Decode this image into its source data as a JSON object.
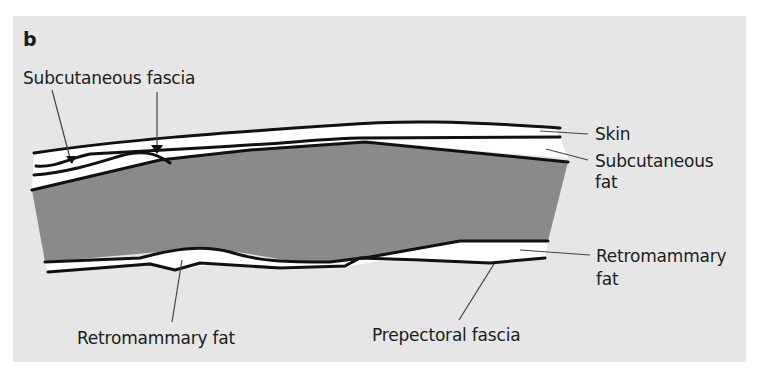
{
  "figure": {
    "panel_letter": "b",
    "colors": {
      "background": "#ffffff",
      "panel": "#e6e6e6",
      "glandular_tissue": "#8a8a8a",
      "fat": "#ffffff",
      "outline": "#111111",
      "leader": "#444444"
    }
  },
  "labels": {
    "subcutaneous_fascia": "Subcutaneous fascia",
    "skin": "Skin",
    "subcutaneous_fat_line1": "Subcutaneous",
    "subcutaneous_fat_line2": "fat",
    "retromammary_fat_right_line1": "Retromammary",
    "retromammary_fat_right_line2": "fat",
    "retromammary_fat_bottom": "Retromammary fat",
    "prepectoral_fascia": "Prepectoral fascia"
  }
}
